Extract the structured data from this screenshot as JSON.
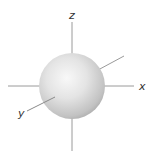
{
  "diagram": {
    "type": "s-orbital-3d-axes",
    "shape": "sphere",
    "axes": {
      "z": {
        "label": "z"
      },
      "x": {
        "label": "x"
      },
      "y": {
        "label": "y"
      }
    },
    "colors": {
      "axis_line": "#9a9a9a",
      "sphere_highlight": "#f8f8f8",
      "sphere_mid": "#dcdcdc",
      "sphere_shadow": "#a8a8a8",
      "label": "#333333",
      "background": "#ffffff"
    }
  }
}
